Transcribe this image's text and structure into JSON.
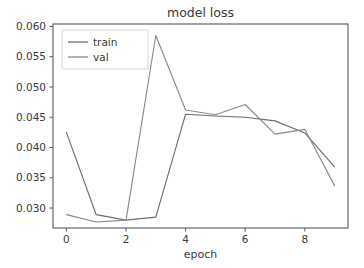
{
  "chart_data": {
    "type": "line",
    "title": "model loss",
    "xlabel": "epoch",
    "ylabel": "",
    "x": [
      0,
      1,
      2,
      3,
      4,
      5,
      6,
      7,
      8,
      9
    ],
    "series": [
      {
        "name": "train",
        "values": [
          0.0425,
          0.0289,
          0.028,
          0.0285,
          0.0455,
          0.0452,
          0.045,
          0.0444,
          0.0424,
          0.0368
        ],
        "color": "#6e6e6e"
      },
      {
        "name": "val",
        "values": [
          0.0289,
          0.0277,
          0.028,
          0.0585,
          0.0462,
          0.0454,
          0.0471,
          0.0422,
          0.043,
          0.0337
        ],
        "color": "#8a8a8a"
      }
    ],
    "xlim": [
      -0.45,
      9.45
    ],
    "ylim": [
      0.0267,
      0.0604
    ],
    "xticks": [
      0,
      2,
      4,
      6,
      8
    ],
    "xtick_labels": [
      "0",
      "2",
      "4",
      "6",
      "8"
    ],
    "yticks": [
      0.03,
      0.035,
      0.04,
      0.045,
      0.05,
      0.055,
      0.06
    ],
    "ytick_labels": [
      "0.030",
      "0.035",
      "0.040",
      "0.045",
      "0.050",
      "0.055",
      "0.060"
    ],
    "grid": false,
    "legend_position": "upper left",
    "legend_entries": [
      "train",
      "val"
    ],
    "background_color": "#ffffff",
    "axis_color": "#555b5f"
  },
  "figure": {
    "title": "model loss",
    "xlabel": "epoch"
  },
  "legend": {
    "entries": [
      {
        "label": "train"
      },
      {
        "label": "val"
      }
    ]
  }
}
